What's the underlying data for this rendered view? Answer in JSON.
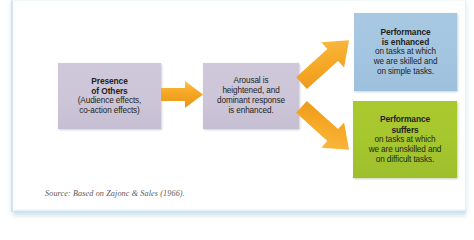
{
  "figure": {
    "source_caption": "Source: Based on Zajonc & Sales (1966).",
    "colors": {
      "purple_box": "#cdc5d8",
      "blue_box": "#a5c6e1",
      "green_box": "#a7c72e",
      "arrow_orange": "#f5a623",
      "card_border": "#cfe4ef",
      "text": "#231f20",
      "caption_text": "#58595b"
    }
  },
  "nodes": {
    "presence": {
      "heading_line1": "Presence",
      "heading_line2": "of Others",
      "body_line1": "(Audience effects,",
      "body_line2": "co-action effects)"
    },
    "arousal": {
      "body_line1": "Arousal is",
      "body_line2": "heightened, and",
      "body_line3": "dominant response",
      "body_line4": "is enhanced."
    },
    "enhanced": {
      "heading_line1": "Performance",
      "heading_line2": "is enhanced",
      "body_line1": "on tasks at which",
      "body_line2": "we are skilled and",
      "body_line3": "on simple tasks."
    },
    "suffers": {
      "heading_line1": "Performance",
      "heading_line2": "suffers",
      "body_line1": "on tasks at which",
      "body_line2": "we are unskilled and",
      "body_line3": "on difficult tasks."
    }
  },
  "arrows": {
    "presence_to_arousal": "arrow-right-icon",
    "arousal_to_enhanced": "arrow-up-right-icon",
    "arousal_to_suffers": "arrow-down-right-icon"
  }
}
